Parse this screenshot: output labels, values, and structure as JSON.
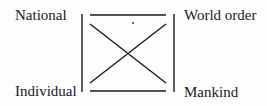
{
  "diagram": {
    "labels": {
      "top_left": "National",
      "top_right": "World order",
      "bottom_left": "Individual",
      "bottom_right": "Mankind"
    },
    "structure": "Square box with crossing diagonals connecting four corner labels",
    "line_color": "#1a1a1a",
    "background_color": "#fdfdfd"
  }
}
